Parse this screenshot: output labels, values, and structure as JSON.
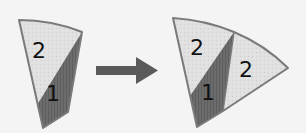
{
  "diagram": {
    "before": {
      "regions": [
        {
          "label": "2",
          "shade": "light"
        },
        {
          "label": "1",
          "shade": "dark"
        }
      ]
    },
    "arrow": {
      "direction": "right"
    },
    "after": {
      "regions": [
        {
          "label": "2",
          "shade": "light"
        },
        {
          "label": "1",
          "shade": "dark"
        },
        {
          "label": "2",
          "shade": "light"
        }
      ]
    },
    "colors": {
      "light": "#dedede",
      "dark": "#6e6e6e",
      "outline": "#7a7a7a",
      "arrow": "#5a5a5a",
      "background": "#f4f4f4"
    }
  }
}
